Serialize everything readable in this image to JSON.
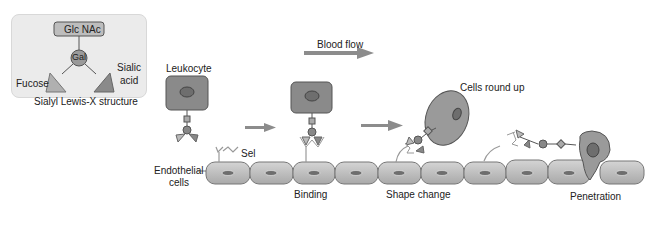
{
  "inset": {
    "top_label": "Glc NAc",
    "center_label": "Gal",
    "left_label": "Fucose",
    "right_label_line1": "Sialic",
    "right_label_line2": "acid",
    "caption": "Sialyl Lewis-X structure"
  },
  "flow": {
    "blood_flow_label": "Blood flow"
  },
  "labels": {
    "leukocyte": "Leukocyte",
    "sel": "Sel",
    "endothelial_line1": "Endothelial",
    "endothelial_line2": "cells",
    "binding": "Binding",
    "shape_change": "Shape change",
    "cells_round_up": "Cells round up",
    "penetration": "Penetration"
  },
  "colors": {
    "cell_fill": "#b8b8b8",
    "leukocyte_fill": "#8a8a8a",
    "nucleus_fill": "#6e6e6e",
    "arrow_fill": "#8c8c8c",
    "inset_bg": "#ebebeb"
  }
}
